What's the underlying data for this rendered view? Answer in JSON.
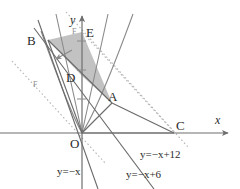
{
  "figure": {
    "type": "math-coordinate-diagram",
    "background": "#ffffff",
    "axes": {
      "x_label": "x",
      "y_label": "y",
      "origin_label": "O",
      "axis_color": "#6e6e6e",
      "x_axis": {
        "y_px": 133,
        "x_start": 0,
        "x_end": 232
      },
      "y_axis": {
        "x_px": 82,
        "y_start": 14,
        "y_end": 189
      },
      "y_ticks_px": [
        41,
        70,
        99
      ],
      "tick_color": "#8a8a8a"
    },
    "points": [
      {
        "name": "A",
        "label": "A",
        "x": 112,
        "y": 103,
        "label_dx": -2,
        "label_dy": -4
      },
      {
        "name": "B",
        "label": "B",
        "x": 48,
        "y": 40,
        "label_dx": -17,
        "label_dy": 1
      },
      {
        "name": "C",
        "label": "C",
        "x": 174,
        "y": 133,
        "label_dx": 3,
        "label_dy": -4
      },
      {
        "name": "D",
        "label": "D",
        "x": 82,
        "y": 76,
        "label_dx": -14,
        "label_dy": 3
      },
      {
        "name": "E",
        "label": "E",
        "x": 82,
        "y": 32,
        "label_dx": 5,
        "label_dy": 3
      },
      {
        "name": "F",
        "label": "F",
        "x": 37,
        "y": 84,
        "label_dx": 0,
        "label_dy": 0
      },
      {
        "name": "F2",
        "label": "F",
        "x": 74,
        "y": 31,
        "label_dx": 0,
        "label_dy": 0
      }
    ],
    "equations": [
      {
        "id": "eq-minus-x-plus-12",
        "text": "y=−x+12",
        "x": 142,
        "y": 157
      },
      {
        "id": "eq-minus-x-plus-6",
        "text": "y=−x+6",
        "x": 128,
        "y": 177
      },
      {
        "id": "eq-minus-x",
        "text": "y=−x",
        "x": 60,
        "y": 174
      }
    ],
    "shaded_region": {
      "fill": "#9c9c9c",
      "opacity": 0.62,
      "vertices": "48,40 82,32 112,103 174,133 112,103 82,76"
    },
    "colors": {
      "curve": "#7a7a7a",
      "solid_line": "#6a6a6a",
      "dotted_line": "#b0b0b0",
      "shade": "#9c9c9c",
      "text": "#2b2b2b"
    },
    "curves": [
      {
        "id": "parabola-narrow",
        "path": "M 56,14 Q 74,96 82,133 Q 90,96 108,14"
      },
      {
        "id": "parabola-wide",
        "path": "M 41,31 Q 70,110 82,133 Q 100,106 133,14"
      }
    ],
    "solid_lines": [
      {
        "id": "line-B-O",
        "x1": 48,
        "y1": 40,
        "x2": 82,
        "y2": 133
      },
      {
        "id": "line-B-A",
        "x1": 48,
        "y1": 40,
        "x2": 112,
        "y2": 103
      },
      {
        "id": "line-B-down",
        "x1": 38,
        "y1": 20,
        "x2": 96,
        "y2": 189
      },
      {
        "id": "line-O-A",
        "x1": 82,
        "y1": 133,
        "x2": 112,
        "y2": 103
      },
      {
        "id": "line-O-C",
        "x1": 82,
        "y1": 133,
        "x2": 174,
        "y2": 133
      },
      {
        "id": "line-minus-x-plus-6",
        "x1": 34,
        "y1": 29,
        "x2": 152,
        "y2": 189
      },
      {
        "id": "line-A-C",
        "x1": 112,
        "y1": 103,
        "x2": 174,
        "y2": 133
      }
    ],
    "dotted_lines": [
      {
        "id": "dotted-minus-x",
        "x1": 12,
        "y1": 61,
        "x2": 104,
        "y2": 162
      },
      {
        "id": "dotted-minus-x-plus-12",
        "x1": 68,
        "y1": 14,
        "x2": 186,
        "y2": 145
      },
      {
        "id": "dotted-E-C",
        "x1": 82,
        "y1": 32,
        "x2": 176,
        "y2": 134
      }
    ],
    "arrow_marker": {
      "id": "region-arrow",
      "x": 62,
      "y": 56,
      "angle": 205
    }
  }
}
